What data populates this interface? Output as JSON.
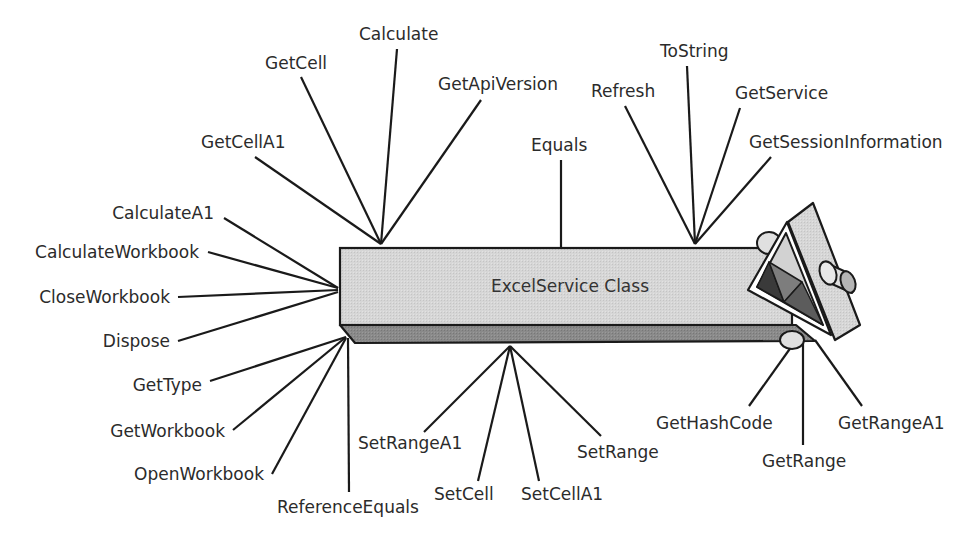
{
  "diagram": {
    "class_box": {
      "title": "ExcelService Class"
    },
    "colors": {
      "box_front": "#d9d9d9",
      "box_bottom": "#8c8c8c",
      "outline": "#1a1a1a",
      "text": "#2b2b2b",
      "prism_light": "#cfcfcf",
      "prism_dark": "#3a3a3a",
      "prism_mid": "#7a7a7a"
    },
    "members_top_left": [
      "GetCell",
      "Calculate",
      "GetApiVersion",
      "GetCellA1"
    ],
    "members_top": [
      "Equals"
    ],
    "members_top_right": [
      "Refresh",
      "ToString",
      "GetService",
      "GetSessionInformation"
    ],
    "members_left": [
      "CalculateA1",
      "CalculateWorkbook",
      "CloseWorkbook",
      "Dispose",
      "GetType",
      "GetWorkbook",
      "OpenWorkbook"
    ],
    "members_bottom_left": [
      "ReferenceEquals"
    ],
    "members_bottom": [
      "SetRangeA1",
      "SetCell",
      "SetCellA1",
      "SetRange"
    ],
    "members_bottom_right": [
      "GetHashCode",
      "GetRange",
      "GetRangeA1"
    ],
    "labels": {
      "GetCell": "GetCell",
      "Calculate": "Calculate",
      "GetApiVersion": "GetApiVersion",
      "GetCellA1": "GetCellA1",
      "Equals": "Equals",
      "Refresh": "Refresh",
      "ToString": "ToString",
      "GetService": "GetService",
      "GetSessionInformation": "GetSessionInformation",
      "CalculateA1": "CalculateA1",
      "CalculateWorkbook": "CalculateWorkbook",
      "CloseWorkbook": "CloseWorkbook",
      "Dispose": "Dispose",
      "GetType": "GetType",
      "GetWorkbook": "GetWorkbook",
      "OpenWorkbook": "OpenWorkbook",
      "ReferenceEquals": "ReferenceEquals",
      "SetRangeA1": "SetRangeA1",
      "SetCell": "SetCell",
      "SetCellA1": "SetCellA1",
      "SetRange": "SetRange",
      "GetHashCode": "GetHashCode",
      "GetRange": "GetRange",
      "GetRangeA1": "GetRangeA1"
    }
  }
}
